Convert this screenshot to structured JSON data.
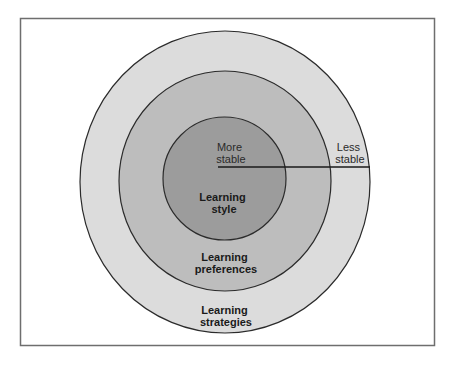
{
  "diagram": {
    "type": "concentric-circles",
    "colors": {
      "frame": "#6e6e6e",
      "outer_ring": "#dcdcdc",
      "middle_ring": "#bdbdbd",
      "inner_core": "#9c9c9c",
      "stroke": "#2b2b2b",
      "background": "#ffffff"
    },
    "layers": [
      {
        "id": "inner",
        "line1": "Learning",
        "line2": "style"
      },
      {
        "id": "middle",
        "line1": "Learning",
        "line2": "preferences"
      },
      {
        "id": "outer",
        "line1": "Learning",
        "line2": "strategies"
      }
    ],
    "scale": {
      "inner_label": {
        "line1": "More",
        "line2": "stable"
      },
      "outer_label": {
        "line1": "Less",
        "line2": "stable"
      }
    }
  }
}
